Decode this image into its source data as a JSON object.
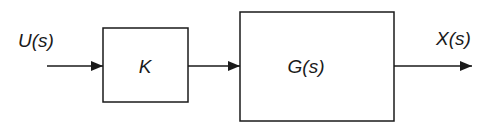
{
  "diagram": {
    "type": "block-diagram",
    "input": {
      "label": "U(s)"
    },
    "blocks": [
      {
        "id": "gain",
        "label": "K"
      },
      {
        "id": "plant",
        "label": "G(s)"
      }
    ],
    "output": {
      "label": "X(s)"
    },
    "connections": [
      {
        "from": "input",
        "to": "gain"
      },
      {
        "from": "gain",
        "to": "plant"
      },
      {
        "from": "plant",
        "to": "output"
      }
    ]
  }
}
